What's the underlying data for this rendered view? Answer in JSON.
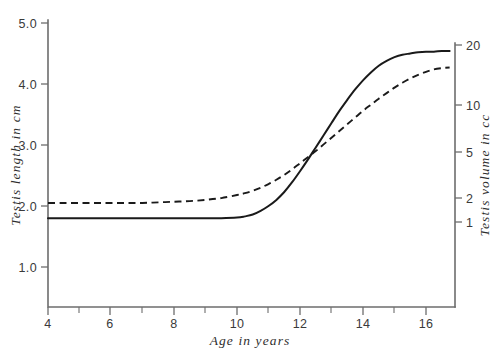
{
  "chart_data": {
    "type": "line",
    "title": "",
    "xlabel": "Age  in  years",
    "ylabel": "Testis  length  in  cm",
    "y2label": "Testis  volume  in  cc",
    "xlim": [
      4,
      17
    ],
    "ylim": [
      0.55,
      5.0
    ],
    "y2lim": [
      1,
      20
    ],
    "y2_scale": "log",
    "grid": false,
    "legend": null,
    "xticks": [
      4,
      5,
      6,
      7,
      8,
      9,
      10,
      11,
      12,
      13,
      14,
      15,
      16,
      17
    ],
    "xticklabels": [
      "4",
      "",
      "6",
      "",
      "8",
      "",
      "10",
      "",
      "12",
      "",
      "14",
      "",
      "16",
      ""
    ],
    "yticks": [
      1.0,
      2.0,
      3.0,
      4.0,
      5.0
    ],
    "yticklabels": [
      "1.0",
      "2.0",
      "3.0",
      "4.0",
      "5.0"
    ],
    "y2ticks": [
      1,
      2,
      5,
      10,
      20
    ],
    "y2ticklabels": [
      "1",
      "2",
      "5",
      "10",
      "20"
    ],
    "series": [
      {
        "name": "testis-length-solid",
        "style": "solid",
        "color": "#1a1a1a",
        "x": [
          4.0,
          4.5,
          5.0,
          5.5,
          6.0,
          6.5,
          7.0,
          7.5,
          8.0,
          8.5,
          9.0,
          9.5,
          10.0,
          10.25,
          10.5,
          10.75,
          11.0,
          11.25,
          11.5,
          11.75,
          12.0,
          12.25,
          12.5,
          12.75,
          13.0,
          13.25,
          13.5,
          13.75,
          14.0,
          14.25,
          14.5,
          14.75,
          15.0,
          15.25,
          15.5,
          15.75,
          16.0,
          16.25,
          16.5,
          16.75
        ],
        "y": [
          1.8,
          1.8,
          1.8,
          1.8,
          1.8,
          1.8,
          1.8,
          1.8,
          1.8,
          1.8,
          1.8,
          1.8,
          1.81,
          1.83,
          1.86,
          1.92,
          2.0,
          2.1,
          2.23,
          2.39,
          2.57,
          2.76,
          2.96,
          3.16,
          3.36,
          3.56,
          3.74,
          3.91,
          4.06,
          4.19,
          4.3,
          4.38,
          4.44,
          4.48,
          4.5,
          4.52,
          4.53,
          4.53,
          4.54,
          4.54
        ]
      },
      {
        "name": "testis-volume-dashed",
        "style": "dashed",
        "color": "#1a1a1a",
        "x": [
          4.0,
          4.5,
          5.0,
          5.5,
          6.0,
          6.5,
          7.0,
          7.5,
          8.0,
          8.5,
          9.0,
          9.5,
          10.0,
          10.25,
          10.5,
          10.75,
          11.0,
          11.25,
          11.5,
          11.75,
          12.0,
          12.25,
          12.5,
          12.75,
          13.0,
          13.25,
          13.5,
          13.75,
          14.0,
          14.25,
          14.5,
          14.75,
          15.0,
          15.25,
          15.5,
          15.75,
          16.0,
          16.25,
          16.5,
          16.75
        ],
        "y": [
          2.05,
          2.05,
          2.05,
          2.05,
          2.05,
          2.05,
          2.05,
          2.06,
          2.07,
          2.08,
          2.1,
          2.13,
          2.18,
          2.21,
          2.25,
          2.3,
          2.36,
          2.43,
          2.51,
          2.6,
          2.7,
          2.8,
          2.9,
          3.01,
          3.12,
          3.23,
          3.34,
          3.45,
          3.56,
          3.66,
          3.76,
          3.85,
          3.94,
          4.02,
          4.09,
          4.15,
          4.2,
          4.24,
          4.26,
          4.27
        ]
      }
    ]
  },
  "axes": {
    "left_title": "Testis  length  in  cm",
    "right_title": "Testis  volume  in  cc",
    "bottom_title": "Age  in  years"
  }
}
